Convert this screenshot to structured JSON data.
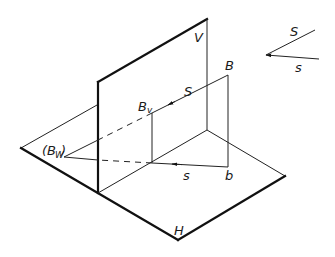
{
  "diagram": {
    "labels": {
      "V": "V",
      "H": "H",
      "B": "B",
      "b": "b",
      "Bv": "B",
      "Bv_sub": "v",
      "Bw_open": "(B",
      "Bw_sub": "W",
      "Bw_close": ")",
      "S_line": "S",
      "s_line": "s",
      "legend_S": "S",
      "legend_s": "s"
    },
    "colors": {
      "stroke": "#111111",
      "background": "#ffffff"
    }
  }
}
